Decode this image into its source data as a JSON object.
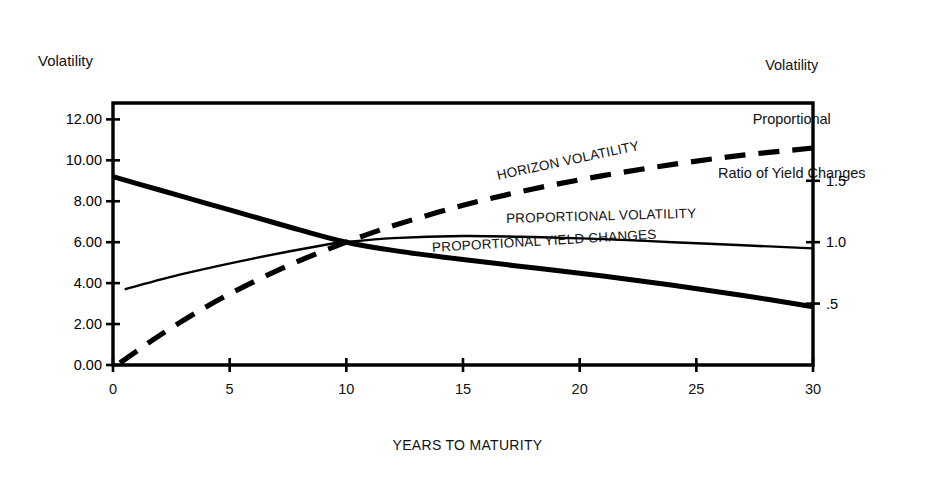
{
  "chart_data": {
    "type": "line",
    "title": "",
    "xlabel": "YEARS TO MATURITY",
    "ylabel": "Volatility",
    "y2label": "Volatility\nProportional\nRatio of Yield Changes",
    "y2label_lines": [
      "Volatility",
      "Proportional",
      "Ratio of Yield Changes"
    ],
    "xlim": [
      0,
      30
    ],
    "ylim": [
      0,
      12.8
    ],
    "y2lim": [
      0,
      2.1333
    ],
    "grid": false,
    "legend": "inline-labels",
    "xticks": [
      0,
      5,
      10,
      15,
      20,
      25,
      30
    ],
    "xtick_labels": [
      "0",
      "5",
      "10",
      "15",
      "20",
      "25",
      "30"
    ],
    "yticks": [
      0,
      2,
      4,
      6,
      8,
      10,
      12
    ],
    "ytick_labels": [
      "0.00",
      "2.00",
      "4.00",
      "6.00",
      "8.00",
      "10.00",
      "12.00"
    ],
    "y2ticks": [
      0.5,
      1.0,
      1.5
    ],
    "y2tick_labels": [
      ".5",
      "1.0",
      "1.5"
    ],
    "series": [
      {
        "name": "HORIZON VOLATILITY",
        "style": "dashed",
        "axis": "right",
        "x": [
          0.3,
          2,
          4,
          6,
          8,
          10,
          12,
          15,
          18,
          21,
          24,
          27,
          30
        ],
        "values_left_scale": [
          0.1,
          1.45,
          2.85,
          4.05,
          5.1,
          6.0,
          6.8,
          7.8,
          8.6,
          9.25,
          9.8,
          10.25,
          10.6
        ],
        "values": [
          0.017,
          0.242,
          0.475,
          0.675,
          0.85,
          1.0,
          1.133,
          1.3,
          1.433,
          1.542,
          1.633,
          1.708,
          1.767
        ]
      },
      {
        "name": "PROPORTIONAL VOLATILITY",
        "style": "solid-thin",
        "axis": "right",
        "x": [
          0.5,
          3,
          6,
          9,
          10,
          12,
          15,
          18,
          21,
          24,
          27,
          30
        ],
        "values_left_scale": [
          3.7,
          4.45,
          5.2,
          5.85,
          6.0,
          6.2,
          6.3,
          6.25,
          6.15,
          6.0,
          5.85,
          5.7
        ],
        "values": [
          0.617,
          0.742,
          0.867,
          0.975,
          1.0,
          1.033,
          1.05,
          1.042,
          1.025,
          1.0,
          0.975,
          0.95
        ]
      },
      {
        "name": "PROPORTIONAL YIELD CHANGES",
        "style": "solid-thick",
        "axis": "left",
        "x": [
          0,
          2,
          4,
          6,
          8,
          10,
          12,
          15,
          18,
          21,
          24,
          27,
          30
        ],
        "values": [
          9.2,
          8.55,
          7.9,
          7.25,
          6.6,
          6.0,
          5.6,
          5.15,
          4.75,
          4.35,
          3.9,
          3.4,
          2.85
        ]
      }
    ]
  },
  "axes": {
    "y_title": "Volatility",
    "x_title": "YEARS TO MATURITY",
    "y2_title_line1": "Volatility",
    "y2_title_line2": "Proportional",
    "y2_title_line3": "Ratio of Yield Changes"
  },
  "series_labels": {
    "horizon_volatility": "HORIZON VOLATILITY",
    "proportional_volatility": "PROPORTIONAL VOLATILITY",
    "proportional_yield_changes": "PROPORTIONAL YIELD CHANGES"
  },
  "colors": {
    "ink": "#000000",
    "background": "#ffffff"
  }
}
